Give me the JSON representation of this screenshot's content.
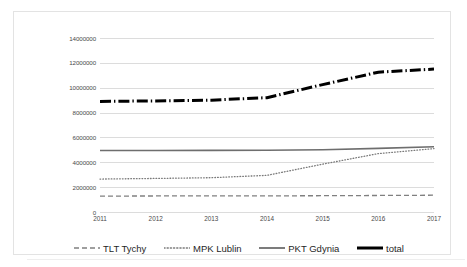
{
  "chart_data": {
    "type": "line",
    "title": "",
    "subtitle": "",
    "xlabel": "",
    "ylabel": "",
    "x": [
      2011,
      2012,
      2013,
      2014,
      2015,
      2016,
      2017
    ],
    "categories": [
      "2011",
      "2012",
      "2013",
      "2014",
      "2015",
      "2016",
      "2017"
    ],
    "xtick_labels": [
      "2011",
      "2012",
      "2013",
      "2014",
      "2015",
      "2016",
      "2017"
    ],
    "ytick_labels": [
      "0",
      "2000000",
      "4000000",
      "6000000",
      "8000000",
      "10000000",
      "12000000",
      "14000000"
    ],
    "ytick_values": [
      0,
      2000000,
      4000000,
      6000000,
      8000000,
      10000000,
      12000000,
      14000000
    ],
    "ylim": [
      0,
      14000000
    ],
    "xlim": [
      2011,
      2017
    ],
    "grid": "horizontal",
    "legend_position": "bottom",
    "series": [
      {
        "name": "TLT Tychy",
        "style": "dashed",
        "color": "#808080",
        "values": [
          1280000,
          1290000,
          1300000,
          1300000,
          1310000,
          1330000,
          1350000
        ]
      },
      {
        "name": "MPK Lublin",
        "style": "dotted",
        "color": "#7a7a7a",
        "values": [
          2650000,
          2700000,
          2760000,
          2950000,
          3850000,
          4700000,
          5100000
        ]
      },
      {
        "name": "PKT Gdynia",
        "style": "solid",
        "color": "#6e6e6e",
        "values": [
          4950000,
          4950000,
          4960000,
          4970000,
          5010000,
          5120000,
          5250000
        ]
      },
      {
        "name": "total",
        "style": "dash-dot",
        "color": "#000000",
        "values": [
          8900000,
          8940000,
          9000000,
          9200000,
          10250000,
          11250000,
          11500000
        ]
      }
    ]
  },
  "legend": {
    "items": [
      {
        "label": "TLT Tychy",
        "swatch": "dashed-line-swatch"
      },
      {
        "label": "MPK Lublin",
        "swatch": "dotted-line-swatch"
      },
      {
        "label": "PKT Gdynia",
        "swatch": "solid-line-swatch"
      },
      {
        "label": "total",
        "swatch": "thick-line-swatch"
      }
    ]
  },
  "colors": {
    "background": "#ffffff",
    "border": "#e3e3e3",
    "gridline": "#dcdcdc",
    "axis_text": "#4a4a4a",
    "legend_text": "#1f1f1f"
  }
}
